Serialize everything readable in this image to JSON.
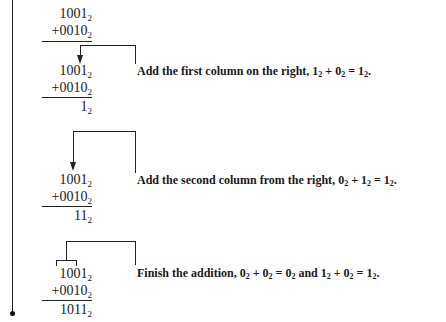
{
  "problem": {
    "addend1": "1001",
    "addend2": "0010",
    "base": "2",
    "plus": "+"
  },
  "steps": [
    {
      "addend1": "1001",
      "addend2": "+0010",
      "result": "1",
      "description": "Add the first column on the right,",
      "equation": [
        {
          "d": "1",
          "s": "2"
        },
        {
          "op": " + "
        },
        {
          "d": "0",
          "s": "2"
        },
        {
          "op": " = "
        },
        {
          "d": "1",
          "s": "2"
        },
        {
          "op": "."
        }
      ]
    },
    {
      "addend1": "1001",
      "addend2": "+0010",
      "result": "11",
      "description": "Add the second column from the right,",
      "equation": [
        {
          "d": "0",
          "s": "2"
        },
        {
          "op": " + "
        },
        {
          "d": "1",
          "s": "2"
        },
        {
          "op": " = "
        },
        {
          "d": "1",
          "s": "2"
        },
        {
          "op": "."
        }
      ]
    },
    {
      "addend1": "1001",
      "addend2": "+0010",
      "result": "1011",
      "description": "Finish the addition,",
      "equation": [
        {
          "d": "0",
          "s": "2"
        },
        {
          "op": " + "
        },
        {
          "d": "0",
          "s": "2"
        },
        {
          "op": " = "
        },
        {
          "d": "0",
          "s": "2"
        },
        {
          "op": " and "
        },
        {
          "d": "1",
          "s": "2"
        },
        {
          "op": " + "
        },
        {
          "d": "0",
          "s": "2"
        },
        {
          "op": " = "
        },
        {
          "d": "1",
          "s": "2"
        },
        {
          "op": "."
        }
      ]
    }
  ],
  "sub": "2"
}
